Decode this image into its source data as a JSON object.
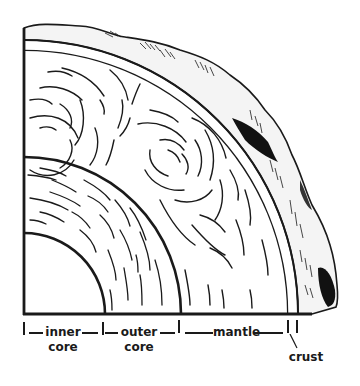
{
  "diagram": {
    "colors": {
      "ink": "#1a1a1a",
      "background": "#ffffff"
    },
    "layers": [
      {
        "id": "inner-core",
        "label_line1": "inner",
        "label_line2": "core"
      },
      {
        "id": "outer-core",
        "label_line1": "outer",
        "label_line2": "core"
      },
      {
        "id": "mantle",
        "label_line1": "mantle",
        "label_line2": ""
      },
      {
        "id": "crust",
        "label_line1": "crust",
        "label_line2": ""
      }
    ]
  }
}
